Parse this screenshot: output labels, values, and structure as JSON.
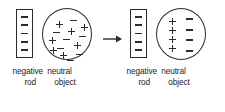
{
  "diagram": {
    "stroke_color": "#2b2b2b",
    "background_color": "#ffffff",
    "arrow": {
      "icon": "arrow-right-icon",
      "direction": "right"
    },
    "panels": [
      {
        "id": "before",
        "rod": {
          "label_line1": "negative",
          "label_line2": "rod",
          "charge_symbol": "minus",
          "charge_count": 5,
          "charges": [
            "-",
            "-",
            "-",
            "-",
            "-"
          ]
        },
        "object": {
          "label_line1": "neutral",
          "label_line2": "object",
          "state": "unpolarized",
          "charge_count": 14,
          "charges": [
            {
              "sign": "+",
              "x": 13,
              "y": 12
            },
            {
              "sign": "-",
              "x": 27,
              "y": 8
            },
            {
              "sign": "-",
              "x": 10,
              "y": 20
            },
            {
              "sign": "+",
              "x": 25,
              "y": 19
            },
            {
              "sign": "+",
              "x": 6,
              "y": 28
            },
            {
              "sign": "-",
              "x": 20,
              "y": 27
            },
            {
              "sign": "-",
              "x": 36,
              "y": 24
            },
            {
              "sign": "+",
              "x": 31,
              "y": 33
            },
            {
              "sign": "-",
              "x": 14,
              "y": 36
            },
            {
              "sign": "+",
              "x": 17,
              "y": 43
            },
            {
              "sign": "-",
              "x": 33,
              "y": 42
            },
            {
              "sign": "+",
              "x": 38,
              "y": 15
            },
            {
              "sign": "-",
              "x": 24,
              "y": 48
            },
            {
              "sign": "+",
              "x": 7,
              "y": 38
            }
          ]
        }
      },
      {
        "id": "after",
        "rod": {
          "label_line1": "negative",
          "label_line2": "rod",
          "charge_symbol": "minus",
          "charge_count": 5,
          "charges": [
            "-",
            "-",
            "-",
            "-",
            "-"
          ]
        },
        "object": {
          "label_line1": "neutral",
          "label_line2": "object",
          "state": "polarized",
          "positive_column_count": 4,
          "negative_column_count": 4,
          "positive_charges": [
            "+",
            "+",
            "+",
            "+"
          ],
          "negative_charges": [
            "-",
            "-",
            "-",
            "-"
          ]
        }
      }
    ]
  }
}
